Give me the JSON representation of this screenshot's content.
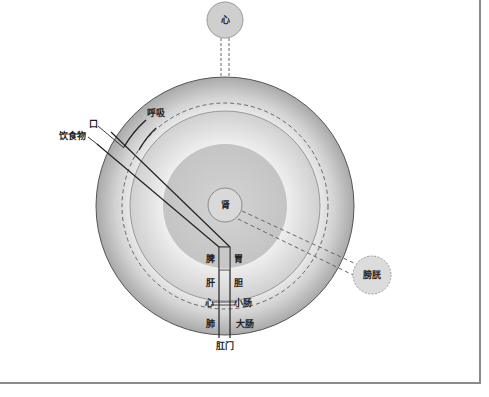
{
  "diagram": {
    "type": "organ-relationship-concentric-diagram",
    "organs_external": {
      "heart_top": "心",
      "bladder": "膀胱",
      "kidney": "肾"
    },
    "inputs": {
      "mouth": "口",
      "breathing": "呼吸",
      "food": "饮食物"
    },
    "channel_left": [
      "脾",
      "肝",
      "心",
      "肺"
    ],
    "channel_right": [
      "胃",
      "胆",
      "小肠",
      "大肠"
    ],
    "outlet": "肛门",
    "colors": {
      "outer_ring": "#bdbdbd",
      "middle_ring": "#e2e2e2",
      "inner_disc": "#c9c9c9",
      "outline": "#333333",
      "dash": "#666666",
      "frame": "#8a8a8a"
    }
  }
}
